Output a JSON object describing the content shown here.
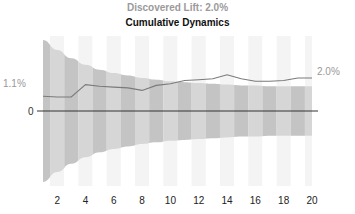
{
  "title": "Discovered Lift: 2.0%",
  "subtitle": "Cumulative Dynamics",
  "colors": {
    "title": "#9a9a9a",
    "subtitle": "#111111",
    "line": "#7a7a7a",
    "band_dark": "#c4c4c4",
    "band_light": "#d6d6d6",
    "stripe_bg": "#f4f4f4",
    "zero_line": "#333333",
    "label": "#999999"
  },
  "labels": {
    "start_value": "1.1%",
    "end_value": "2.0%",
    "zero": "0"
  },
  "chart_data": {
    "type": "line",
    "title": "Discovered Lift: 2.0%",
    "subtitle": "Cumulative Dynamics",
    "xlabel": "",
    "ylabel": "",
    "x": [
      1,
      2,
      3,
      4,
      5,
      6,
      7,
      8,
      9,
      10,
      11,
      12,
      13,
      14,
      15,
      16,
      17,
      18,
      19,
      20
    ],
    "x_ticks": [
      "2",
      "4",
      "6",
      "8",
      "10",
      "12",
      "14",
      "16",
      "18",
      "20"
    ],
    "series": [
      {
        "name": "cumulative lift",
        "values": [
          0.9,
          0.85,
          0.85,
          1.6,
          1.5,
          1.45,
          1.4,
          1.25,
          1.55,
          1.65,
          1.85,
          1.9,
          1.95,
          2.2,
          1.95,
          1.8,
          1.8,
          1.85,
          2.0,
          2.0
        ]
      }
    ],
    "confidence_band": {
      "upper": [
        4.3,
        3.7,
        3.2,
        2.8,
        2.5,
        2.3,
        2.15,
        2.0,
        1.9,
        1.8,
        1.75,
        1.7,
        1.65,
        1.6,
        1.55,
        1.55,
        1.5,
        1.5,
        1.5,
        1.5
      ],
      "lower": [
        -4.3,
        -3.7,
        -3.2,
        -2.8,
        -2.5,
        -2.3,
        -2.15,
        -2.0,
        -1.9,
        -1.8,
        -1.75,
        -1.7,
        -1.65,
        -1.6,
        -1.55,
        -1.55,
        -1.5,
        -1.5,
        -1.5,
        -1.5
      ]
    },
    "annotations": [
      "1.1%",
      "2.0%",
      "0"
    ],
    "grid": false,
    "legend": null
  }
}
